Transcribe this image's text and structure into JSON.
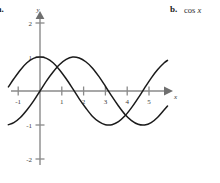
{
  "parts": {
    "a_label": "a.",
    "b_label": "b.",
    "b_expression_fn": "cos",
    "b_expression_var": "x"
  },
  "chart_data": {
    "type": "line",
    "title": "",
    "xlabel": "x",
    "ylabel": "y",
    "xlim": [
      -1.45,
      5.85
    ],
    "ylim": [
      -2.35,
      2.25
    ],
    "grid": false,
    "legend": "none",
    "x_ticks": [
      -1,
      1,
      2,
      3,
      4,
      5
    ],
    "x_tick_labels": [
      "-1",
      "1",
      "2",
      "3",
      "4",
      "5"
    ],
    "y_ticks": [
      2,
      1,
      -1,
      -2
    ],
    "y_tick_labels": [
      "2",
      "1",
      "-1",
      "-2"
    ],
    "series": [
      {
        "name": "cos x",
        "formula": "cos(x)",
        "amplitude": 1,
        "period": 6.2832,
        "phase": 0,
        "points_x": [
          -1.45,
          -1.2,
          -0.9,
          -0.6,
          -0.3,
          0,
          0.3,
          0.6,
          0.9,
          1.2,
          1.5,
          1.8,
          2.1,
          2.4,
          2.7,
          3.0,
          3.3,
          3.6,
          3.9,
          4.2,
          4.5,
          4.8,
          5.1,
          5.4,
          5.7,
          5.85
        ],
        "points_y": [
          0.12,
          0.36,
          0.62,
          0.83,
          0.96,
          1.0,
          0.96,
          0.83,
          0.62,
          0.36,
          0.07,
          -0.23,
          -0.5,
          -0.74,
          -0.9,
          -0.99,
          -0.99,
          -0.9,
          -0.73,
          -0.49,
          -0.21,
          0.09,
          0.38,
          0.63,
          0.83,
          0.9
        ]
      },
      {
        "name": "sin x",
        "formula": "sin(x)",
        "amplitude": 1,
        "period": 6.2832,
        "phase": 0,
        "points_x": [
          -1.45,
          -1.2,
          -0.9,
          -0.6,
          -0.3,
          0,
          0.3,
          0.6,
          0.9,
          1.2,
          1.5,
          1.8,
          2.1,
          2.4,
          2.7,
          3.0,
          3.3,
          3.6,
          3.9,
          4.2,
          4.5,
          4.8,
          5.1,
          5.4,
          5.7,
          5.85
        ],
        "points_y": [
          -0.99,
          -0.93,
          -0.78,
          -0.56,
          -0.3,
          0,
          0.3,
          0.56,
          0.78,
          0.93,
          1.0,
          0.97,
          0.86,
          0.68,
          0.43,
          0.14,
          -0.16,
          -0.44,
          -0.69,
          -0.87,
          -0.98,
          -1.0,
          -0.93,
          -0.77,
          -0.55,
          -0.44
        ]
      }
    ]
  },
  "colors": {
    "curve": "#1b1b1b",
    "axis": "#8a8a8a",
    "text": "#2b2b2b",
    "background": "#ffffff"
  }
}
